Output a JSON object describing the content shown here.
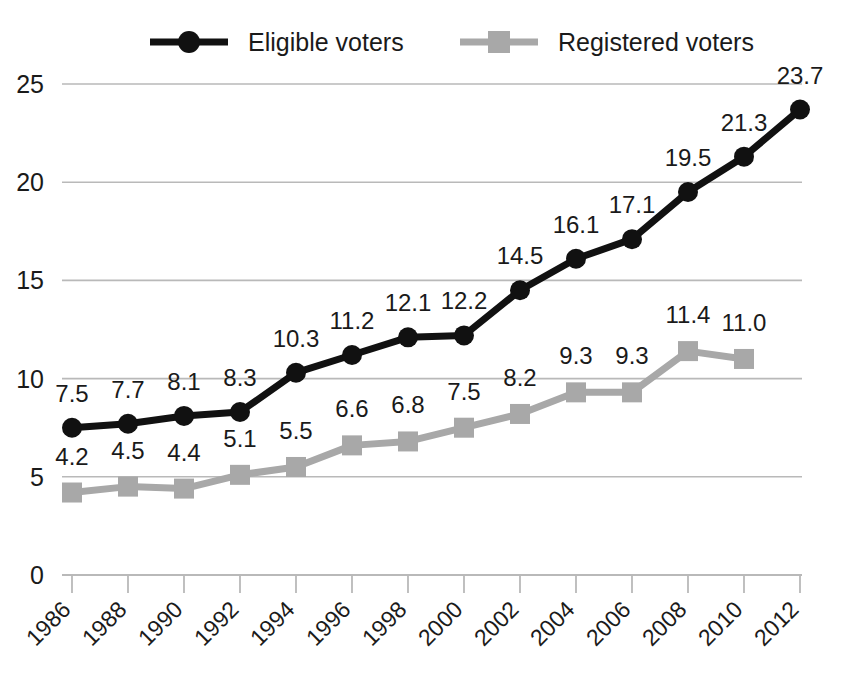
{
  "chart_data": {
    "type": "line",
    "title": "",
    "subtitle": "",
    "xlabel": "",
    "ylabel": "",
    "categories": [
      "1986",
      "1988",
      "1990",
      "1992",
      "1994",
      "1996",
      "1998",
      "2000",
      "2002",
      "2004",
      "2006",
      "2008",
      "2010",
      "2012"
    ],
    "ylim": [
      0,
      25
    ],
    "yticks": [
      "0",
      "5",
      "10",
      "15",
      "20",
      "25"
    ],
    "ytick_values": [
      0,
      5,
      10,
      15,
      20,
      25
    ],
    "grid": "horizontal",
    "legend_position": "top",
    "series": [
      {
        "name": "Eligible voters",
        "color": "#111111",
        "marker": "circle",
        "values": [
          7.5,
          7.7,
          8.1,
          8.3,
          10.3,
          11.2,
          12.1,
          12.2,
          14.5,
          16.1,
          17.1,
          19.5,
          21.3,
          23.7
        ],
        "labels": [
          "7.5",
          "7.7",
          "8.1",
          "8.3",
          "10.3",
          "11.2",
          "12.1",
          "12.2",
          "14.5",
          "16.1",
          "17.1",
          "19.5",
          "21.3",
          "23.7"
        ]
      },
      {
        "name": "Registered voters",
        "color": "#a8a8a8",
        "marker": "square",
        "values": [
          4.2,
          4.5,
          4.4,
          5.1,
          5.5,
          6.6,
          6.8,
          7.5,
          8.2,
          9.3,
          9.3,
          11.4,
          11.0,
          null
        ],
        "labels": [
          "4.2",
          "4.5",
          "4.4",
          "5.1",
          "5.5",
          "6.6",
          "6.8",
          "7.5",
          "8.2",
          "9.3",
          "9.3",
          "11.4",
          "11.0",
          null
        ]
      }
    ]
  },
  "legend": {
    "items": [
      {
        "label": "Eligible voters",
        "color": "#111111",
        "marker": "circle"
      },
      {
        "label": "Registered voters",
        "color": "#a8a8a8",
        "marker": "square"
      }
    ]
  },
  "colors": {
    "eligible": "#111111",
    "registered": "#a8a8a8",
    "grid": "#b9b9b9",
    "text": "#1a1a1a",
    "background": "#ffffff"
  }
}
